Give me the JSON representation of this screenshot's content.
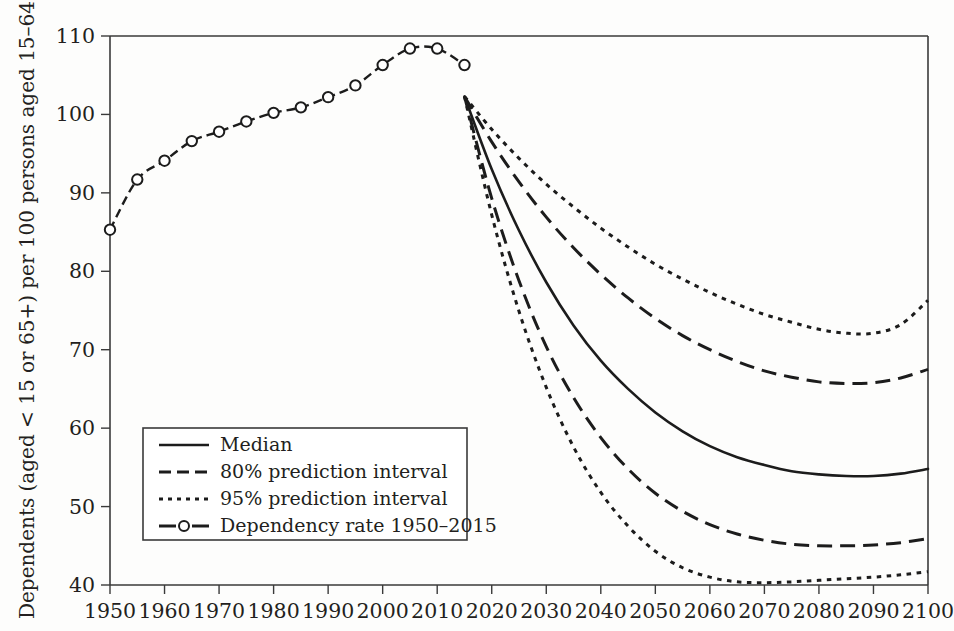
{
  "chart_data": {
    "type": "line",
    "title": "",
    "xlabel": "",
    "ylabel": "Dependents (aged < 15 or 65+) per 100 persons aged 15–64",
    "xlim": [
      1950,
      2100
    ],
    "ylim": [
      40,
      110
    ],
    "grid": false,
    "legend_position": "lower-left-inside",
    "xticks": [
      1950,
      1960,
      1970,
      1980,
      1990,
      2000,
      2010,
      2020,
      2030,
      2040,
      2050,
      2060,
      2070,
      2080,
      2090,
      2100
    ],
    "yticks": [
      40,
      50,
      60,
      70,
      80,
      90,
      100,
      110
    ],
    "series": [
      {
        "name": "Dependency rate 1950–2015",
        "style": "dashed-with-open-circle-markers",
        "x": [
          1950,
          1955,
          1960,
          1965,
          1970,
          1975,
          1980,
          1985,
          1990,
          1995,
          2000,
          2005,
          2010,
          2015
        ],
        "values": [
          85.3,
          91.7,
          94.1,
          96.6,
          97.8,
          99.1,
          100.2,
          100.9,
          102.2,
          103.7,
          106.3,
          108.4,
          108.4,
          106.3
        ]
      },
      {
        "name": "Median",
        "style": "solid",
        "x": [
          2015,
          2020,
          2025,
          2030,
          2035,
          2040,
          2045,
          2050,
          2055,
          2060,
          2065,
          2070,
          2075,
          2080,
          2085,
          2090,
          2095,
          2100
        ],
        "values": [
          102.3,
          93.0,
          85.2,
          78.6,
          73.1,
          68.6,
          65.0,
          62.0,
          59.6,
          57.7,
          56.3,
          55.3,
          54.5,
          54.1,
          53.9,
          53.9,
          54.2,
          54.8
        ]
      },
      {
        "name": "80% prediction interval upper",
        "style": "dashed",
        "x": [
          2015,
          2020,
          2025,
          2030,
          2035,
          2040,
          2045,
          2050,
          2055,
          2060,
          2065,
          2070,
          2075,
          2080,
          2085,
          2090,
          2095,
          2100
        ],
        "values": [
          102.3,
          96.5,
          91.4,
          86.9,
          83.0,
          79.6,
          76.6,
          74.0,
          71.8,
          70.0,
          68.5,
          67.3,
          66.5,
          65.9,
          65.7,
          65.8,
          66.4,
          67.5
        ]
      },
      {
        "name": "80% prediction interval lower",
        "style": "dashed",
        "x": [
          2015,
          2020,
          2025,
          2030,
          2035,
          2040,
          2045,
          2050,
          2055,
          2060,
          2065,
          2070,
          2075,
          2080,
          2085,
          2090,
          2095,
          2100
        ],
        "values": [
          102.3,
          89.3,
          78.8,
          70.4,
          63.9,
          58.8,
          54.8,
          51.7,
          49.4,
          47.7,
          46.5,
          45.7,
          45.2,
          45.0,
          45.0,
          45.1,
          45.4,
          45.9
        ]
      },
      {
        "name": "95% prediction interval upper",
        "style": "dotted",
        "x": [
          2015,
          2020,
          2025,
          2030,
          2035,
          2040,
          2045,
          2050,
          2055,
          2060,
          2065,
          2070,
          2075,
          2080,
          2085,
          2090,
          2095,
          2100
        ],
        "values": [
          102.3,
          98.1,
          94.4,
          91.1,
          88.2,
          85.5,
          83.1,
          80.9,
          79.0,
          77.3,
          75.8,
          74.5,
          73.5,
          72.6,
          72.1,
          72.1,
          73.2,
          76.3
        ]
      },
      {
        "name": "95% prediction interval lower",
        "style": "dotted",
        "x": [
          2015,
          2020,
          2025,
          2030,
          2035,
          2040,
          2045,
          2050,
          2055,
          2060,
          2065,
          2070,
          2075,
          2080,
          2085,
          2090,
          2095,
          2100
        ],
        "values": [
          102.3,
          87.2,
          74.9,
          65.2,
          57.6,
          51.8,
          47.5,
          44.3,
          42.2,
          41.0,
          40.4,
          40.3,
          40.4,
          40.6,
          40.8,
          41.0,
          41.3,
          41.7
        ]
      }
    ]
  },
  "legend": {
    "items": [
      {
        "label": "Median",
        "style": "solid"
      },
      {
        "label": "80% prediction interval",
        "style": "dashed"
      },
      {
        "label": "95% prediction interval",
        "style": "dotted"
      },
      {
        "label": "Dependency rate 1950–2015",
        "style": "marker"
      }
    ]
  }
}
